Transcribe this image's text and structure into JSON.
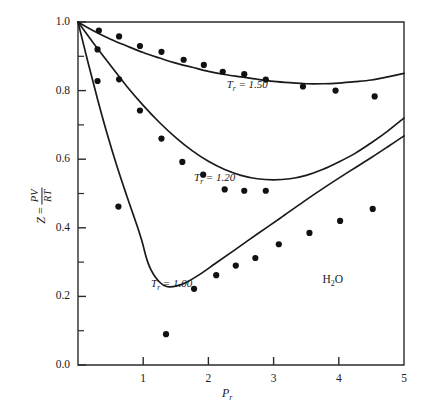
{
  "figure": {
    "substance_label": "H",
    "substance_sub": "2",
    "substance_tail": "O",
    "y_axis_title_z": "Z",
    "y_axis_title_eq": " = ",
    "y_axis_num": "PV",
    "y_axis_den": "RT",
    "x_axis_title": "P",
    "x_axis_sub": "r"
  },
  "chart_data": {
    "type": "scatter",
    "title": "",
    "subtitle": "",
    "xlabel": "P_r",
    "ylabel": "Z = PV/RT",
    "xlim": [
      0,
      5
    ],
    "ylim": [
      0,
      1.0
    ],
    "grid": false,
    "legend": "inline-curve-labels",
    "annotations": [
      {
        "text": "T_r = 1.50",
        "x": 2.28,
        "y": 0.815
      },
      {
        "text": "T_r = 1.20",
        "x": 1.78,
        "y": 0.545
      },
      {
        "text": "T_r = 1.00",
        "x": 1.12,
        "y": 0.235
      },
      {
        "text": "H2O",
        "x": 3.75,
        "y": 0.245
      }
    ],
    "x_ticks": [
      1,
      2,
      3,
      4,
      5
    ],
    "x_tick_labels": [
      "1",
      "2",
      "3",
      "4",
      "5"
    ],
    "x_minor_ticks": [
      0.5,
      1.5,
      2.5,
      3.5,
      4.5
    ],
    "y_ticks": [
      0.0,
      0.2,
      0.4,
      0.6,
      0.8,
      1.0
    ],
    "y_tick_labels": [
      "0.0",
      "0.2",
      "0.4",
      "0.6",
      "0.8",
      "1.0"
    ],
    "y_minor_ticks": [
      0.1,
      0.3,
      0.5,
      0.7,
      0.9
    ],
    "series": [
      {
        "name": "T_r = 1.50",
        "kind": "curve",
        "points": [
          [
            0.0,
            1.0
          ],
          [
            0.25,
            0.973
          ],
          [
            0.5,
            0.95
          ],
          [
            0.75,
            0.93
          ],
          [
            1.0,
            0.911
          ],
          [
            1.25,
            0.895
          ],
          [
            1.5,
            0.88
          ],
          [
            1.75,
            0.868
          ],
          [
            2.0,
            0.856
          ],
          [
            2.25,
            0.847
          ],
          [
            2.5,
            0.84
          ],
          [
            2.75,
            0.833
          ],
          [
            3.0,
            0.827
          ],
          [
            3.25,
            0.823
          ],
          [
            3.5,
            0.82
          ],
          [
            3.75,
            0.82
          ],
          [
            4.0,
            0.822
          ],
          [
            4.25,
            0.826
          ],
          [
            4.5,
            0.831
          ],
          [
            4.75,
            0.84
          ],
          [
            5.0,
            0.85
          ]
        ]
      },
      {
        "name": "T_r = 1.50 data",
        "kind": "points",
        "points": [
          [
            0.32,
            0.975
          ],
          [
            0.63,
            0.958
          ],
          [
            0.95,
            0.93
          ],
          [
            1.28,
            0.913
          ],
          [
            1.62,
            0.89
          ],
          [
            1.93,
            0.875
          ],
          [
            2.22,
            0.855
          ],
          [
            2.55,
            0.848
          ],
          [
            2.88,
            0.832
          ],
          [
            3.45,
            0.812
          ],
          [
            3.95,
            0.8
          ],
          [
            4.55,
            0.783
          ]
        ]
      },
      {
        "name": "T_r = 1.20",
        "kind": "curve",
        "points": [
          [
            0.0,
            1.0
          ],
          [
            0.25,
            0.935
          ],
          [
            0.5,
            0.873
          ],
          [
            0.75,
            0.812
          ],
          [
            1.0,
            0.757
          ],
          [
            1.25,
            0.707
          ],
          [
            1.5,
            0.663
          ],
          [
            1.75,
            0.625
          ],
          [
            2.0,
            0.594
          ],
          [
            2.25,
            0.57
          ],
          [
            2.5,
            0.553
          ],
          [
            2.75,
            0.543
          ],
          [
            3.0,
            0.54
          ],
          [
            3.25,
            0.543
          ],
          [
            3.5,
            0.553
          ],
          [
            3.75,
            0.57
          ],
          [
            4.0,
            0.592
          ],
          [
            4.25,
            0.617
          ],
          [
            4.5,
            0.648
          ],
          [
            4.75,
            0.682
          ],
          [
            5.0,
            0.72
          ]
        ]
      },
      {
        "name": "T_r = 1.20 data",
        "kind": "points",
        "points": [
          [
            0.3,
            0.92
          ],
          [
            0.63,
            0.833
          ],
          [
            0.95,
            0.742
          ],
          [
            1.28,
            0.66
          ],
          [
            1.6,
            0.592
          ],
          [
            1.92,
            0.555
          ],
          [
            2.25,
            0.512
          ],
          [
            2.55,
            0.508
          ],
          [
            2.88,
            0.508
          ]
        ]
      },
      {
        "name": "T_r = 1.00",
        "kind": "curve",
        "points": [
          [
            0.0,
            1.0
          ],
          [
            0.15,
            0.885
          ],
          [
            0.3,
            0.775
          ],
          [
            0.45,
            0.672
          ],
          [
            0.6,
            0.578
          ],
          [
            0.75,
            0.492
          ],
          [
            0.85,
            0.437
          ],
          [
            0.92,
            0.398
          ],
          [
            0.97,
            0.368
          ],
          [
            1.0,
            0.348
          ],
          [
            1.03,
            0.325
          ],
          [
            1.07,
            0.3
          ],
          [
            1.12,
            0.277
          ],
          [
            1.18,
            0.258
          ],
          [
            1.25,
            0.242
          ],
          [
            1.32,
            0.232
          ],
          [
            1.4,
            0.228
          ],
          [
            1.5,
            0.23
          ],
          [
            1.65,
            0.24
          ],
          [
            1.85,
            0.262
          ],
          [
            2.1,
            0.295
          ],
          [
            2.4,
            0.335
          ],
          [
            2.75,
            0.382
          ],
          [
            3.1,
            0.428
          ],
          [
            3.45,
            0.475
          ],
          [
            3.8,
            0.52
          ],
          [
            4.15,
            0.563
          ],
          [
            4.5,
            0.605
          ],
          [
            4.78,
            0.64
          ],
          [
            5.0,
            0.668
          ]
        ]
      },
      {
        "name": "T_r = 1.00 data",
        "kind": "points",
        "points": [
          [
            0.3,
            0.828
          ],
          [
            0.62,
            0.462
          ],
          [
            1.35,
            0.09
          ],
          [
            1.78,
            0.222
          ],
          [
            2.12,
            0.262
          ],
          [
            2.42,
            0.29
          ],
          [
            2.72,
            0.312
          ],
          [
            3.08,
            0.352
          ],
          [
            3.55,
            0.385
          ],
          [
            4.02,
            0.42
          ],
          [
            4.52,
            0.455
          ]
        ]
      }
    ]
  }
}
